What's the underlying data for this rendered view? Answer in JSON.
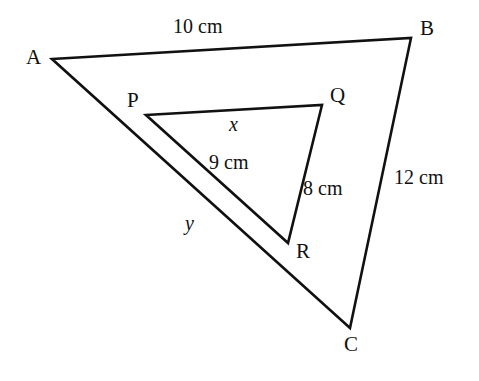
{
  "figure": {
    "type": "geometry-diagram",
    "background_color": "#ffffff",
    "stroke_color": "#111111"
  },
  "outer_triangle": {
    "name": "ABC",
    "vertices": [
      {
        "label": "A",
        "x": 52,
        "y": 59,
        "label_x": 26,
        "label_y": 47
      },
      {
        "label": "B",
        "x": 411,
        "y": 38,
        "label_x": 420,
        "label_y": 18
      },
      {
        "label": "C",
        "x": 350,
        "y": 328,
        "label_x": 344,
        "label_y": 334
      }
    ],
    "sides": [
      {
        "name": "AB",
        "from": "A",
        "to": "B",
        "label": "10 cm",
        "label_x": 173,
        "label_y": 16
      },
      {
        "name": "BC",
        "from": "B",
        "to": "C",
        "label": "12 cm",
        "label_x": 394,
        "label_y": 167
      },
      {
        "name": "CA",
        "from": "C",
        "to": "A",
        "label": "y",
        "label_x": 185,
        "label_y": 213
      }
    ]
  },
  "inner_triangle": {
    "name": "PQR",
    "vertices": [
      {
        "label": "P",
        "x": 146,
        "y": 115,
        "label_x": 127,
        "label_y": 90
      },
      {
        "label": "Q",
        "x": 322,
        "y": 105,
        "label_x": 330,
        "label_y": 85
      },
      {
        "label": "R",
        "x": 288,
        "y": 243,
        "label_x": 296,
        "label_y": 241
      }
    ],
    "sides": [
      {
        "name": "PQ",
        "from": "P",
        "to": "Q",
        "label": "x",
        "label_x": 229,
        "label_y": 114
      },
      {
        "name": "QR",
        "from": "Q",
        "to": "R",
        "label": "8 cm",
        "label_x": 303,
        "label_y": 178
      },
      {
        "name": "RP",
        "from": "R",
        "to": "P",
        "label": "9 cm",
        "label_x": 209,
        "label_y": 152
      }
    ]
  },
  "labels": {
    "a": "A",
    "b": "B",
    "c": "C",
    "p": "P",
    "q": "Q",
    "r": "R",
    "ab": "10 cm",
    "bc": "12 cm",
    "ca": "y",
    "pq": "x",
    "qr": "8 cm",
    "rp": "9 cm"
  }
}
